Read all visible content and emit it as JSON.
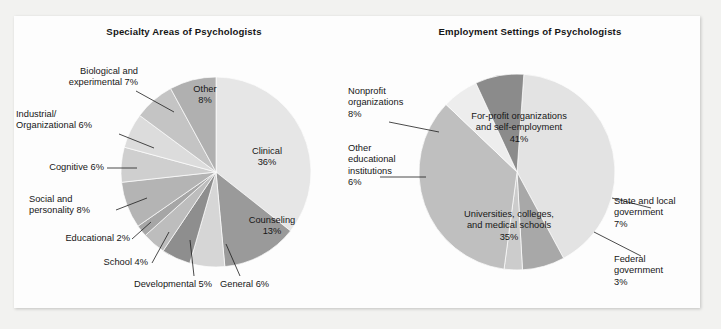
{
  "figure": {
    "background_color": "#f2f2f0",
    "panel_color": "#fdfdfd"
  },
  "chart_data": [
    {
      "type": "pie",
      "id": "specialty-areas",
      "title": "Specialty Areas of Psychologists",
      "xlabel": "",
      "ylabel": "",
      "legend": "none (labels placed around pie)",
      "units": "percent",
      "total": 100,
      "categories": [
        "Clinical",
        "Counseling",
        "General",
        "Developmental",
        "School",
        "Educational",
        "Social and personality",
        "Cognitive",
        "Industrial/Organizational",
        "Biological and experimental",
        "Other"
      ],
      "values": [
        36,
        13,
        6,
        5,
        4,
        2,
        8,
        6,
        6,
        7,
        8
      ],
      "slice_colors": [
        "#e6e6e6",
        "#9a9a9a",
        "#d6d6d6",
        "#8e8e8e",
        "#bdbdbd",
        "#a6a6a6",
        "#b4b4b4",
        "#cfcfcf",
        "#dcdcdc",
        "#c4c4c4",
        "#b0b0b0"
      ],
      "labels": [
        {
          "key": "clinical",
          "text": "Clinical\n36%",
          "placement": "inside"
        },
        {
          "key": "counseling",
          "text": "Counseling\n13%",
          "placement": "inside"
        },
        {
          "key": "general",
          "text": "General 6%",
          "placement": "outside-leader"
        },
        {
          "key": "developmental",
          "text": "Developmental 5%",
          "placement": "outside-leader"
        },
        {
          "key": "school",
          "text": "School 4%",
          "placement": "outside-leader"
        },
        {
          "key": "educational",
          "text": "Educational 2%",
          "placement": "outside-leader"
        },
        {
          "key": "social",
          "text": "Social and\npersonality 8%",
          "placement": "outside-leader"
        },
        {
          "key": "cognitive",
          "text": "Cognitive 6%",
          "placement": "outside-leader"
        },
        {
          "key": "industrial",
          "text": "Industrial/\nOrganizational 6%",
          "placement": "outside-leader"
        },
        {
          "key": "biological",
          "text": "Biological and\nexperimental 7%",
          "placement": "outside-leader"
        },
        {
          "key": "other",
          "text": "Other\n8%",
          "placement": "inside"
        }
      ]
    },
    {
      "type": "pie",
      "id": "employment-settings",
      "title": "Employment Settings of Psychologists",
      "xlabel": "",
      "ylabel": "",
      "legend": "none (labels placed around pie)",
      "units": "percent",
      "total": 100,
      "categories": [
        "For-profit organizations and self-employment",
        "State and local government",
        "Federal government",
        "Universities, colleges, and medical schools",
        "Other educational institutions",
        "Nonprofit organizations"
      ],
      "values": [
        41,
        7,
        3,
        35,
        6,
        8
      ],
      "slice_colors": [
        "#e3e3e3",
        "#a8a8a8",
        "#cccccc",
        "#bfbfbf",
        "#ededed",
        "#8b8b8b"
      ],
      "labels": [
        {
          "key": "for-profit",
          "text": "For-profit organizations\nand self-employment\n41%",
          "placement": "inside"
        },
        {
          "key": "state-local",
          "text": "State and local\ngovernment\n7%",
          "placement": "outside-leader"
        },
        {
          "key": "federal",
          "text": "Federal\ngovernment\n3%",
          "placement": "outside-leader"
        },
        {
          "key": "universities",
          "text": "Universities, colleges,\nand medical schools\n35%",
          "placement": "inside"
        },
        {
          "key": "other-edu",
          "text": "Other\neducational\ninstitutions\n6%",
          "placement": "outside-leader"
        },
        {
          "key": "nonprofit",
          "text": "Nonprofit\norganizations\n8%",
          "placement": "outside-leader"
        }
      ]
    }
  ]
}
